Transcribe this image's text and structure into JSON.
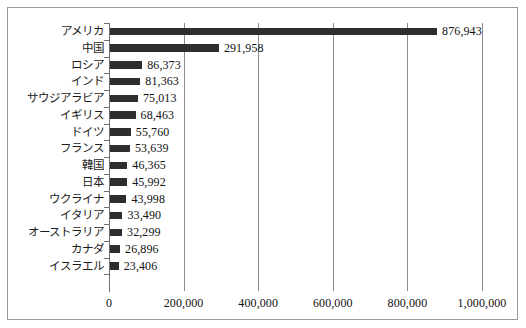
{
  "chart_data": {
    "type": "bar",
    "orientation": "horizontal",
    "title": "",
    "subtitle": "",
    "xlabel": "",
    "ylabel": "",
    "xlim": [
      0,
      1000000
    ],
    "grid": true,
    "legend": "none",
    "xticks": [
      "0",
      "200,000",
      "400,000",
      "600,000",
      "800,000",
      "1,000,000"
    ],
    "xtick_values": [
      0,
      200000,
      400000,
      600000,
      800000,
      1000000
    ],
    "categories": [
      "アメリカ",
      "中国",
      "ロシア",
      "インド",
      "サウジアラビア",
      "イギリス",
      "ドイツ",
      "フランス",
      "韓国",
      "日本",
      "ウクライナ",
      "イタリア",
      "オーストラリア",
      "カナダ",
      "イスラエル"
    ],
    "values": [
      876943,
      291958,
      86373,
      81363,
      75013,
      68463,
      55760,
      53639,
      46365,
      45992,
      43998,
      33490,
      32299,
      26896,
      23406
    ],
    "value_labels": [
      "876,943",
      "291,958",
      "86,373",
      "81,363",
      "75,013",
      "68,463",
      "55,760",
      "53,639",
      "46,365",
      "45,992",
      "43,998",
      "33,490",
      "32,299",
      "26,896",
      "23,406"
    ],
    "colors": {
      "bar": "#2e2e2e",
      "gridline": "#8d8d8d",
      "axis": "#6f6f6f",
      "frame": "#9a9a9a",
      "background": "#ffffff",
      "text": "#111111"
    }
  }
}
